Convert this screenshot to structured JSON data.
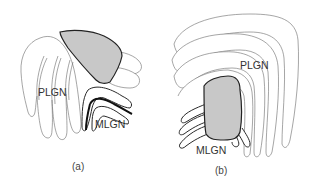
{
  "figure": {
    "panels": [
      {
        "id": "a",
        "caption": "(a)",
        "labels": {
          "plgn": "PLGN",
          "mlgn": "MLGN"
        }
      },
      {
        "id": "b",
        "caption": "(b)",
        "labels": {
          "plgn": "PLGN",
          "mlgn": "MLGN"
        }
      }
    ],
    "colors": {
      "shaded_region": "#c8c8c8",
      "outline": "#6a6a6a",
      "bold_outline": "#111111",
      "background": "#ffffff"
    }
  }
}
